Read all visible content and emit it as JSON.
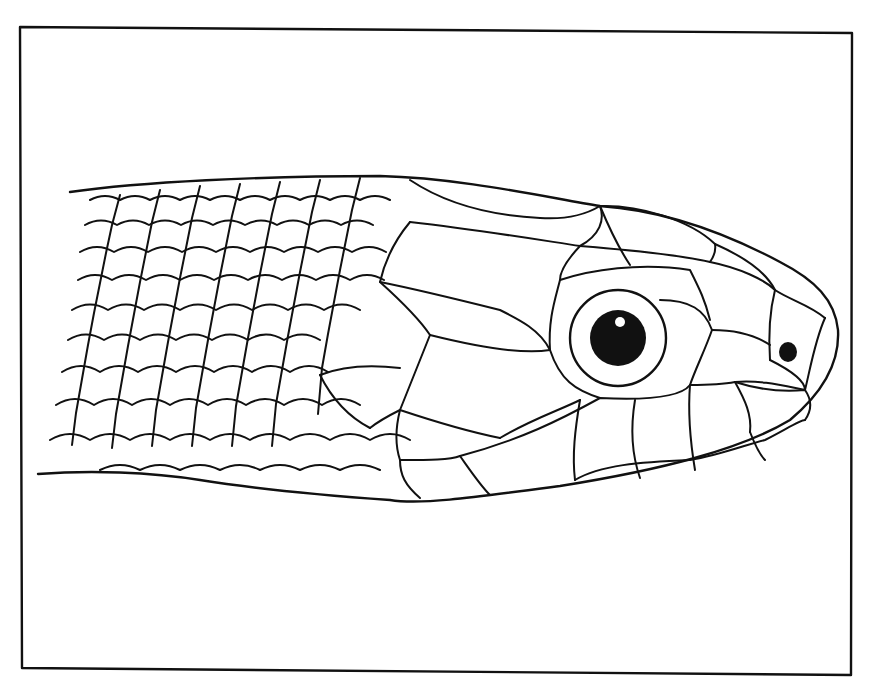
{
  "figure": {
    "frame_color": "#111111",
    "background": "#ffffff",
    "ink": "#111111"
  }
}
